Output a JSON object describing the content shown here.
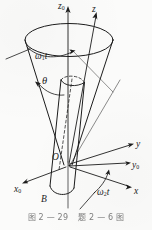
{
  "figure": {
    "type": "mechanics-kinematics-diagram",
    "background_color": "#fbfbfa",
    "ink_color": "#1c1c1c",
    "labels": [
      {
        "id": "axis-z0",
        "text": "z",
        "sub": "0",
        "x": 58,
        "y": 2,
        "size": "sz9"
      },
      {
        "id": "axis-z",
        "text": "z",
        "sub": "",
        "x": 92,
        "y": 6,
        "size": "sz9"
      },
      {
        "id": "angle-w1t",
        "text": "ω",
        "sub": "1",
        "suffix": "t",
        "x": 35,
        "y": 52,
        "size": "sz9"
      },
      {
        "id": "angle-theta",
        "text": "θ",
        "sub": "",
        "x": 42,
        "y": 77,
        "size": "sz10"
      },
      {
        "id": "axis-y",
        "text": "y",
        "sub": "",
        "x": 136,
        "y": 142,
        "size": "sz9"
      },
      {
        "id": "axis-y0",
        "text": "y",
        "sub": "0",
        "x": 133,
        "y": 163,
        "size": "sz9"
      },
      {
        "id": "origin-O",
        "text": "O",
        "sub": "",
        "x": 52,
        "y": 154,
        "size": "sz9"
      },
      {
        "id": "axis-x0",
        "text": "x",
        "sub": "0",
        "x": 14,
        "y": 186,
        "size": "sz9"
      },
      {
        "id": "point-B",
        "text": "B",
        "sub": "",
        "x": 41,
        "y": 196,
        "size": "sz9"
      },
      {
        "id": "angle-w2t",
        "text": "ω",
        "sub": "2",
        "suffix": "t",
        "x": 97,
        "y": 189,
        "size": "sz9"
      },
      {
        "id": "axis-x",
        "text": "x",
        "sub": "",
        "x": 135,
        "y": 188,
        "size": "sz9"
      }
    ],
    "caption": {
      "left": "图 2 — 29",
      "right": "题 2 — 6 图"
    }
  }
}
